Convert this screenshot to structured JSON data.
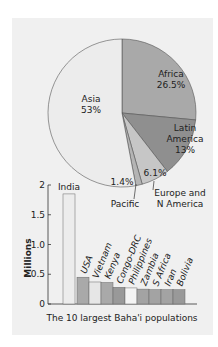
{
  "chart_data": [
    {
      "type": "pie",
      "title": "",
      "slices": [
        {
          "label": "Africa",
          "value": 26.5,
          "display": "26.5%",
          "color": "#a9a9a9"
        },
        {
          "label": "Latin America",
          "value": 13,
          "display": "13%",
          "color": "#8f8f8f"
        },
        {
          "label": "Europe and N America",
          "value": 6.1,
          "display": "6.1%",
          "color": "#c6c6c6"
        },
        {
          "label": "Pacific",
          "value": 1.4,
          "display": "1.4%",
          "color": "#b4b4b4"
        },
        {
          "label": "Asia",
          "value": 53,
          "display": "53%",
          "color": "#ececec"
        }
      ],
      "label_lines": {
        "africa": [
          "Africa",
          "26.5%"
        ],
        "latin_america": [
          "Latin",
          "America",
          "13%"
        ],
        "europe": [
          "Europe and",
          "N America"
        ],
        "europe_pct": "6.1%",
        "pacific": "Pacific",
        "pacific_pct": "1.4%",
        "asia": [
          "Asia",
          "53%"
        ]
      }
    },
    {
      "type": "bar",
      "title": "The 10 largest Baha'i populations",
      "xlabel": "The 10 largest Baha'i populations",
      "ylabel": "Millions",
      "ylim": [
        0,
        2
      ],
      "yticks": [
        0,
        0.5,
        1.0,
        1.5,
        2
      ],
      "ytick_labels": [
        "0",
        "0.5",
        "1.0",
        "1.5",
        "2"
      ],
      "categories": [
        "India",
        "USA",
        "Vietnam",
        "Kenya",
        "Congo-DRC",
        "Philippines",
        "Zambia",
        "S Africa",
        "Iran",
        "Bolivia"
      ],
      "values": [
        1.85,
        0.45,
        0.37,
        0.36,
        0.28,
        0.27,
        0.25,
        0.24,
        0.24,
        0.24
      ],
      "colors": [
        "#ececec",
        "#a9a9a9",
        "#e6e6e6",
        "#a9a9a9",
        "#999999",
        "#f4f4f4",
        "#a3a3a3",
        "#a3a3a3",
        "#a3a3a3",
        "#999999"
      ]
    }
  ]
}
